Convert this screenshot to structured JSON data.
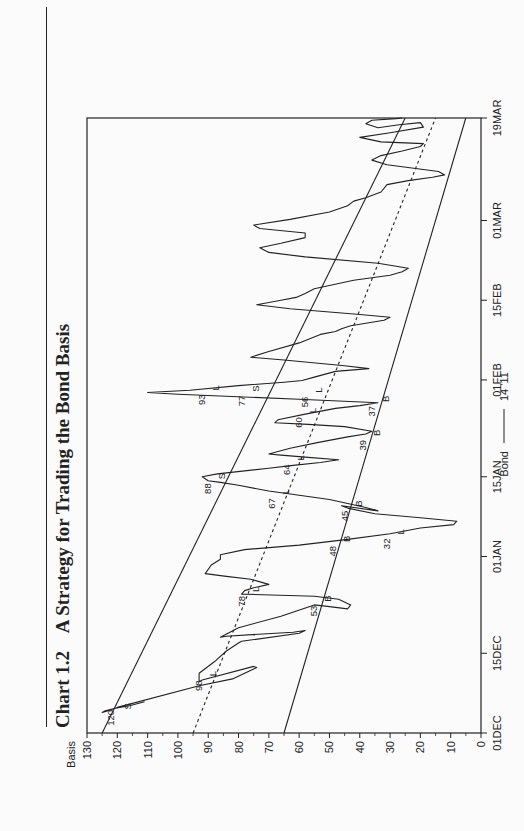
{
  "header": {
    "chart_number": "Chart 1.2",
    "title": "A Strategy for Trading the Bond Basis"
  },
  "legend": {
    "series_label": "Bond",
    "line_label": "14 '11"
  },
  "chart_data": {
    "type": "line",
    "title": "A Strategy for Trading the Bond Basis",
    "ylabel": "Basis",
    "xlabel": "",
    "ylim": [
      0,
      130
    ],
    "yticks": [
      0,
      10,
      20,
      30,
      40,
      50,
      60,
      70,
      80,
      90,
      100,
      110,
      120,
      130
    ],
    "xticks": [
      {
        "label": "01DEC",
        "day": 0
      },
      {
        "label": "15DEC",
        "day": 14
      },
      {
        "label": "01JAN",
        "day": 31
      },
      {
        "label": "15JAN",
        "day": 45
      },
      {
        "label": "01FEB",
        "day": 62
      },
      {
        "label": "15FEB",
        "day": 76
      },
      {
        "label": "01MAR",
        "day": 90
      },
      {
        "label": "19MAR",
        "day": 108
      }
    ],
    "xlim_days": [
      0,
      108
    ],
    "grid": false,
    "legend_position": "bottom",
    "series": [
      {
        "name": "Bond 14 '11",
        "style": "solid",
        "points": [
          [
            5.5,
            111
          ],
          [
            4.8,
            116
          ],
          [
            4.3,
            121
          ],
          [
            3.9,
            124
          ],
          [
            3.6,
            125
          ],
          [
            3.9,
            123
          ],
          [
            4.5,
            120
          ],
          [
            8.3,
            93
          ],
          [
            9.5,
            82
          ],
          [
            11.5,
            74
          ],
          [
            11.7,
            75
          ],
          [
            9.3,
            92
          ],
          [
            9.0,
            93
          ],
          [
            10.5,
            93
          ],
          [
            12.5,
            88
          ],
          [
            14.4,
            84
          ],
          [
            15.8,
            80
          ],
          [
            16.1,
            79
          ],
          [
            17.5,
            60
          ],
          [
            18.0,
            58
          ],
          [
            17.7,
            62
          ],
          [
            17.0,
            84
          ],
          [
            16.8,
            86
          ],
          [
            18.5,
            80
          ],
          [
            20.5,
            66
          ],
          [
            22.5,
            55
          ],
          [
            22.2,
            50
          ],
          [
            21.8,
            44
          ],
          [
            22.5,
            43
          ],
          [
            23.5,
            47
          ],
          [
            24.0,
            55
          ],
          [
            24.4,
            79
          ],
          [
            25.0,
            78
          ],
          [
            25.5,
            75
          ],
          [
            26.1,
            70
          ],
          [
            27.0,
            76
          ],
          [
            27.5,
            84
          ],
          [
            28.0,
            91
          ],
          [
            29.5,
            89
          ],
          [
            30.5,
            86
          ],
          [
            31.3,
            86
          ],
          [
            32.2,
            78
          ],
          [
            33.0,
            60
          ],
          [
            34.0,
            44
          ],
          [
            35.0,
            30
          ],
          [
            36.0,
            20
          ],
          [
            36.6,
            9
          ],
          [
            37.2,
            8
          ],
          [
            37.8,
            20
          ],
          [
            38.5,
            35
          ],
          [
            39.5,
            44
          ],
          [
            39.9,
            46
          ],
          [
            39.0,
            34
          ],
          [
            39.6,
            38
          ],
          [
            41.0,
            50
          ],
          [
            42.5,
            70
          ],
          [
            43.5,
            80
          ],
          [
            44.0,
            86
          ],
          [
            44.3,
            90
          ],
          [
            45.0,
            92
          ],
          [
            45.5,
            87
          ],
          [
            46.5,
            70
          ],
          [
            47.0,
            62
          ],
          [
            47.5,
            53
          ],
          [
            48.0,
            47
          ],
          [
            48.4,
            57
          ],
          [
            48.8,
            66
          ],
          [
            49.0,
            70
          ],
          [
            50.0,
            63
          ],
          [
            51.0,
            54
          ],
          [
            52.0,
            44
          ],
          [
            52.5,
            38
          ],
          [
            53.0,
            36
          ],
          [
            53.8,
            45
          ],
          [
            54.2,
            57
          ],
          [
            54.5,
            68
          ],
          [
            55.0,
            67
          ],
          [
            56.0,
            58
          ],
          [
            57.0,
            48
          ],
          [
            57.5,
            40
          ],
          [
            58.0,
            34
          ],
          [
            58.6,
            60
          ],
          [
            59.5,
            100
          ],
          [
            59.8,
            110
          ],
          [
            60.2,
            96
          ],
          [
            61.0,
            80
          ],
          [
            61.6,
            65
          ],
          [
            61.9,
            59
          ],
          [
            62.5,
            55
          ],
          [
            63.5,
            48
          ],
          [
            64.0,
            37
          ],
          [
            64.5,
            45
          ],
          [
            65.5,
            65
          ],
          [
            66.0,
            76
          ],
          [
            67.0,
            70
          ],
          [
            68.5,
            60
          ],
          [
            70.0,
            53
          ],
          [
            70.5,
            48
          ],
          [
            71.0,
            46
          ],
          [
            71.5,
            43
          ],
          [
            72.5,
            32
          ],
          [
            73.0,
            30
          ],
          [
            73.5,
            40
          ],
          [
            74.5,
            63
          ],
          [
            75.2,
            74
          ],
          [
            76.0,
            66
          ],
          [
            76.5,
            61
          ],
          [
            77.2,
            58
          ],
          [
            78.0,
            55
          ],
          [
            79.5,
            42
          ],
          [
            80.4,
            30
          ],
          [
            81.0,
            26
          ],
          [
            81.6,
            24
          ],
          [
            82.5,
            34
          ],
          [
            83.6,
            58
          ],
          [
            84.4,
            70
          ],
          [
            85.2,
            73
          ],
          [
            86.0,
            66
          ],
          [
            87.0,
            58
          ],
          [
            87.8,
            58
          ],
          [
            88.6,
            73
          ],
          [
            89.2,
            75
          ],
          [
            90.2,
            63
          ],
          [
            91.5,
            50
          ],
          [
            92.6,
            44
          ],
          [
            93.4,
            42
          ],
          [
            94.0,
            38
          ],
          [
            95.0,
            33
          ],
          [
            96.3,
            31
          ],
          [
            97.0,
            24
          ],
          [
            97.6,
            16
          ],
          [
            98.0,
            12
          ],
          [
            98.6,
            14
          ],
          [
            99.8,
            31
          ],
          [
            100.6,
            36
          ],
          [
            101.4,
            33
          ],
          [
            102.2,
            26
          ],
          [
            103.0,
            20
          ],
          [
            103.5,
            19
          ],
          [
            103.8,
            33
          ],
          [
            104.6,
            40
          ],
          [
            105.4,
            30
          ],
          [
            106.4,
            19
          ],
          [
            107.2,
            20
          ],
          [
            106.8,
            27
          ],
          [
            106.3,
            34
          ],
          [
            107.0,
            38
          ],
          [
            107.6,
            36
          ],
          [
            107.9,
            28
          ],
          [
            108.0,
            26
          ]
        ]
      },
      {
        "name": "Upper channel",
        "style": "solid",
        "points": [
          [
            0,
            125
          ],
          [
            108,
            25
          ]
        ]
      },
      {
        "name": "Middle trend",
        "style": "dashed",
        "points": [
          [
            0,
            95
          ],
          [
            108,
            15
          ]
        ]
      },
      {
        "name": "Lower channel",
        "style": "solid",
        "points": [
          [
            0,
            65
          ],
          [
            108,
            5
          ]
        ]
      }
    ],
    "annotations": [
      {
        "text": "S",
        "day": 3.8,
        "basis": 119,
        "side": "below"
      },
      {
        "text": "120",
        "day": 4.4,
        "basis": 120,
        "side": "above"
      },
      {
        "text": "L",
        "day": 9.6,
        "basis": 91,
        "side": "below"
      },
      {
        "text": "98",
        "day": 9.6,
        "basis": 91,
        "side": "above"
      },
      {
        "text": "L",
        "day": 24.4,
        "basis": 77,
        "side": "below"
      },
      {
        "text": "78",
        "day": 24.4,
        "basis": 77,
        "side": "above"
      },
      {
        "text": "B",
        "day": 22.7,
        "basis": 53,
        "side": "below"
      },
      {
        "text": "53",
        "day": 22.7,
        "basis": 53,
        "side": "above"
      },
      {
        "text": "B",
        "day": 33.2,
        "basis": 47,
        "side": "below"
      },
      {
        "text": "48",
        "day": 33.2,
        "basis": 47,
        "side": "above"
      },
      {
        "text": "L",
        "day": 34.5,
        "basis": 29,
        "side": "below"
      },
      {
        "text": "32",
        "day": 34.5,
        "basis": 29,
        "side": "above"
      },
      {
        "text": "B",
        "day": 39.4,
        "basis": 43,
        "side": "below"
      },
      {
        "text": "45",
        "day": 39.4,
        "basis": 43,
        "side": "above"
      },
      {
        "text": "L",
        "day": 41.6,
        "basis": 67,
        "side": "below"
      },
      {
        "text": "67",
        "day": 41.6,
        "basis": 67,
        "side": "above"
      },
      {
        "text": "S",
        "day": 44.2,
        "basis": 88,
        "side": "below"
      },
      {
        "text": "88",
        "day": 44.2,
        "basis": 88,
        "side": "above"
      },
      {
        "text": "L",
        "day": 47.5,
        "basis": 62,
        "side": "below"
      },
      {
        "text": "64",
        "day": 47.5,
        "basis": 62,
        "side": "above"
      },
      {
        "text": "B",
        "day": 51.8,
        "basis": 37,
        "side": "below"
      },
      {
        "text": "39",
        "day": 51.8,
        "basis": 37,
        "side": "above"
      },
      {
        "text": "L",
        "day": 55.8,
        "basis": 58,
        "side": "below"
      },
      {
        "text": "60",
        "day": 55.8,
        "basis": 58,
        "side": "above"
      },
      {
        "text": "B",
        "day": 57.8,
        "basis": 34,
        "side": "below"
      },
      {
        "text": "37",
        "day": 57.8,
        "basis": 34,
        "side": "above"
      },
      {
        "text": "L",
        "day": 59.8,
        "basis": 90,
        "side": "below"
      },
      {
        "text": "93",
        "day": 59.8,
        "basis": 90,
        "side": "above"
      },
      {
        "text": "S",
        "day": 59.6,
        "basis": 77,
        "side": "below"
      },
      {
        "text": "77",
        "day": 59.6,
        "basis": 77,
        "side": "above"
      },
      {
        "text": "L",
        "day": 59.4,
        "basis": 56,
        "side": "below"
      },
      {
        "text": "56",
        "day": 59.4,
        "basis": 56,
        "side": "above"
      }
    ]
  }
}
